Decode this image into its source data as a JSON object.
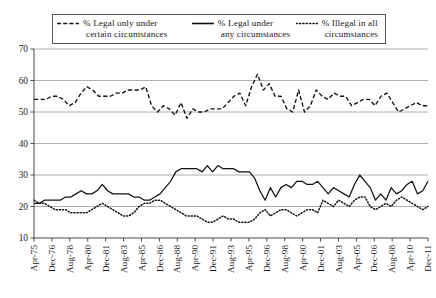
{
  "chart_data": {
    "type": "line",
    "title": "",
    "subtitle": "",
    "xlabel": "",
    "ylabel": "",
    "ylim": [
      10,
      70
    ],
    "ytick_step": 10,
    "yticks": [
      10,
      20,
      30,
      40,
      50,
      60,
      70
    ],
    "grid": true,
    "legend_position": "top",
    "tick_labels": [
      "Apr-75",
      "Dec-76",
      "Aug-78",
      "Apr-80",
      "Dec-81",
      "Aug-83",
      "Apr-85",
      "Dec-86",
      "Aug-88",
      "Apr-90",
      "Dec-91",
      "Aug-93",
      "Apr-95",
      "Dec-96",
      "Aug-98",
      "Apr-00",
      "Dec-01",
      "Aug-03",
      "Apr-05",
      "Dec-06",
      "Aug-08",
      "Apr-10",
      "Dec-11"
    ],
    "series": [
      {
        "name": "% Legal only under certain circumstances",
        "style": "dashed",
        "color": "#111111",
        "values": [
          54,
          54,
          54,
          55,
          55,
          54,
          52,
          53,
          56,
          58,
          57,
          55,
          55,
          55,
          56,
          56,
          57,
          57,
          57,
          58,
          52,
          50,
          52,
          51,
          49,
          53,
          48,
          51,
          50,
          50,
          51,
          51,
          51,
          53,
          55,
          56,
          52,
          58,
          62,
          57,
          59,
          55,
          55,
          51,
          50,
          57,
          50,
          52,
          57,
          55,
          54,
          56,
          55,
          55,
          52,
          53,
          54,
          54,
          52,
          55,
          56,
          53,
          50,
          51,
          52,
          53,
          52,
          52
        ]
      },
      {
        "name": "% Legal under any circumstances",
        "style": "solid",
        "color": "#111111",
        "values": [
          21,
          21,
          22,
          22,
          22,
          22,
          23,
          23,
          24,
          25,
          24,
          24,
          25,
          27,
          25,
          24,
          24,
          24,
          24,
          23,
          23,
          22,
          22,
          23,
          24,
          26,
          28,
          31,
          32,
          32,
          32,
          32,
          31,
          33,
          31,
          33,
          32,
          32,
          32,
          31,
          31,
          31,
          29,
          25,
          22,
          26,
          23,
          26,
          27,
          26,
          28,
          28,
          27,
          27,
          28,
          26,
          24,
          26,
          25,
          24,
          23,
          27,
          30,
          28,
          26,
          22,
          24,
          22,
          26,
          24,
          25,
          27,
          28,
          24,
          25,
          28
        ]
      },
      {
        "name": "% Illegal in all circumstances",
        "style": "dotted",
        "color": "#111111",
        "values": [
          22,
          21,
          21,
          20,
          19,
          19,
          19,
          18,
          18,
          18,
          18,
          19,
          20,
          21,
          20,
          19,
          18,
          17,
          17,
          18,
          20,
          21,
          21,
          22,
          22,
          21,
          20,
          19,
          18,
          17,
          17,
          17,
          16,
          15,
          15,
          16,
          17,
          16,
          16,
          15,
          15,
          15,
          16,
          18,
          19,
          17,
          18,
          19,
          19,
          18,
          17,
          18,
          19,
          19,
          18,
          22,
          21,
          20,
          22,
          21,
          20,
          22,
          23,
          23,
          20,
          19,
          20,
          21,
          20,
          22,
          23,
          22,
          21,
          20,
          19,
          20
        ]
      }
    ]
  },
  "legend": {
    "entries": [
      {
        "swatch": "dashed-line-swatch",
        "line1": "% Legal only under",
        "line2": "certain circumstances"
      },
      {
        "swatch": "solid-line-swatch",
        "line1": "% Legal under",
        "line2": "any circumstances"
      },
      {
        "swatch": "dotted-line-swatch",
        "line1": "% Illegal in all",
        "line2": "circumstances"
      }
    ]
  },
  "colors": {
    "axis": "#4a4a4a",
    "grid": "#9b9b9b",
    "line": "#111111",
    "background": "#ffffff"
  }
}
